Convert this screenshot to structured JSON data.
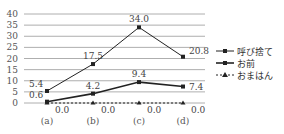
{
  "chart_data": {
    "type": "line",
    "title": "",
    "xlabel": "",
    "ylabel": "",
    "categories": [
      "(a)",
      "(b)",
      "(c)",
      "(d)"
    ],
    "ylim": [
      0,
      40
    ],
    "yticks": [
      0,
      5,
      10,
      15,
      20,
      25,
      30,
      35,
      40
    ],
    "grid": true,
    "legend_position": "right",
    "series": [
      {
        "name": "呼び捨て",
        "values": [
          5.4,
          17.5,
          34.0,
          20.8
        ],
        "labels": [
          "5.4",
          "17.5",
          "34.0",
          "20.8"
        ],
        "style": "solid",
        "marker": "square"
      },
      {
        "name": "お前",
        "values": [
          0.6,
          4.2,
          9.4,
          7.4
        ],
        "labels": [
          "0.6",
          "4.2",
          "9.4",
          "7.4"
        ],
        "style": "solid-thick",
        "marker": "square"
      },
      {
        "name": "おまはん",
        "values": [
          0.0,
          0.0,
          0.0,
          0.0
        ],
        "labels": [
          "0.0",
          "0.0",
          "0.0",
          "0.0"
        ],
        "style": "dashed",
        "marker": "triangle"
      }
    ]
  },
  "legend": {
    "items": [
      "呼び捨て",
      "お前",
      "おまはん"
    ]
  }
}
